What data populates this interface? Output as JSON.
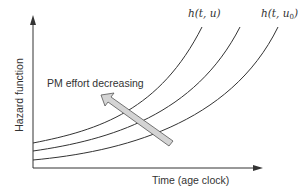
{
  "diagram": {
    "y_axis_label": "Hazard function",
    "x_axis_label": "Time (age clock)",
    "annotation": "PM effort decreasing",
    "curve_labels": {
      "top": {
        "prefix": "h(t, u",
        "suffix": ")",
        "full": "h(t, u)",
        "sub": ""
      },
      "bottom": {
        "prefix": "h(t, u",
        "sub": "0",
        "suffix": ")",
        "full": "h(t, u0)"
      }
    },
    "curves": [
      {
        "name": "h(t, u)",
        "start": [
          33,
          143
        ],
        "end": [
          202,
          27
        ]
      },
      {
        "name": "intermediate",
        "start": [
          33,
          151
        ],
        "end": [
          240,
          27
        ]
      },
      {
        "name": "h(t, u0)",
        "start": [
          33,
          160
        ],
        "end": [
          278,
          27
        ]
      }
    ],
    "colors": {
      "line": "#333333",
      "arrow_fill": "#d4d4d4",
      "arrow_stroke": "#555555"
    }
  }
}
